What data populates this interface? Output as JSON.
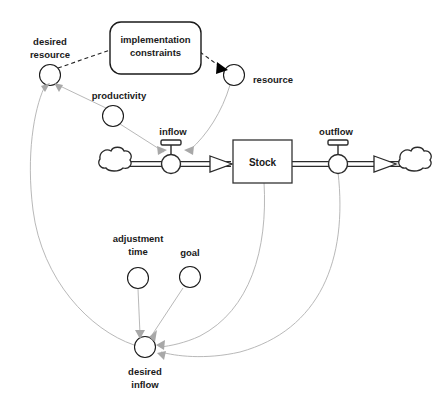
{
  "diagram": {
    "type": "system-dynamics-stock-flow",
    "colors": {
      "background": "#ffffff",
      "outline": "#2b2b2b",
      "text": "#1a1a1a",
      "info_link": "#b0b0b0",
      "gray_arrowhead": "#a8a8a8",
      "black_arrowhead": "#000000"
    },
    "stock": {
      "label": "Stock",
      "shape": "rectangle"
    },
    "boxes": [
      {
        "id": "implementation-constraints",
        "label_line1": "implementation",
        "label_line2": "constraints",
        "shape": "rounded-rectangle"
      }
    ],
    "valves": [
      {
        "id": "inflow",
        "label": "inflow"
      },
      {
        "id": "outflow",
        "label": "outflow"
      }
    ],
    "clouds": [
      {
        "id": "source-cloud",
        "label": ""
      },
      {
        "id": "sink-cloud",
        "label": ""
      }
    ],
    "auxiliaries": [
      {
        "id": "desired-resource",
        "label_line1": "desired",
        "label_line2": "resource"
      },
      {
        "id": "resource",
        "label_line1": "resource",
        "label_line2": ""
      },
      {
        "id": "productivity",
        "label_line1": "productivity",
        "label_line2": ""
      },
      {
        "id": "adjustment-time",
        "label_line1": "adjustment",
        "label_line2": "time"
      },
      {
        "id": "goal",
        "label_line1": "goal",
        "label_line2": ""
      },
      {
        "id": "desired-inflow",
        "label_line1": "desired",
        "label_line2": "inflow"
      }
    ],
    "links": [
      {
        "id": "desired-resource-to-constraints",
        "from": "desired-resource",
        "to": "implementation-constraints",
        "style": "dashed",
        "arrowhead": "none"
      },
      {
        "id": "constraints-to-resource",
        "from": "implementation-constraints",
        "to": "resource",
        "style": "dashed",
        "arrowhead": "solid-black"
      },
      {
        "id": "resource-to-inflow",
        "from": "resource",
        "to": "inflow",
        "style": "info",
        "arrowhead": "gray"
      },
      {
        "id": "productivity-to-desired-resource",
        "from": "productivity",
        "to": "desired-resource",
        "style": "info",
        "arrowhead": "gray"
      },
      {
        "id": "productivity-to-inflow",
        "from": "productivity",
        "to": "inflow",
        "style": "info",
        "arrowhead": "gray"
      },
      {
        "id": "desired-inflow-to-desired-resource",
        "from": "desired-inflow",
        "to": "desired-resource",
        "style": "info",
        "arrowhead": "gray"
      },
      {
        "id": "adjustment-time-to-desired-inflow",
        "from": "adjustment-time",
        "to": "desired-inflow",
        "style": "info",
        "arrowhead": "gray"
      },
      {
        "id": "goal-to-desired-inflow",
        "from": "goal",
        "to": "desired-inflow",
        "style": "info",
        "arrowhead": "gray"
      },
      {
        "id": "stock-to-desired-inflow",
        "from": "stock",
        "to": "desired-inflow",
        "style": "info",
        "arrowhead": "gray"
      },
      {
        "id": "outflow-to-desired-inflow",
        "from": "outflow",
        "to": "desired-inflow",
        "style": "info",
        "arrowhead": "gray"
      }
    ],
    "flows": [
      {
        "id": "inflow-pipe",
        "from": "source-cloud",
        "through": "inflow",
        "to": "stock"
      },
      {
        "id": "outflow-pipe",
        "from": "stock",
        "through": "outflow",
        "to": "sink-cloud"
      }
    ]
  }
}
